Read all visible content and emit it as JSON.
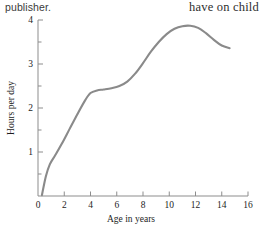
{
  "page": {
    "width": 263,
    "height": 233,
    "background": "#ffffff"
  },
  "surrounding_text": {
    "top_left": "publisher.",
    "top_right": "have on child"
  },
  "colors": {
    "curve": "#8a8a8a",
    "axis": "#8d8d8d",
    "text": "#1d1d1d",
    "sans_text": "#3a3a3a"
  },
  "chart_data": {
    "type": "line",
    "title": "",
    "xlabel": "Age in years",
    "ylabel": "Hours per day",
    "xlim": [
      0,
      16
    ],
    "ylim": [
      0,
      4.2
    ],
    "grid": false,
    "legend": null,
    "x_ticks": [
      0,
      2,
      4,
      6,
      8,
      10,
      12,
      14,
      16
    ],
    "x_tick_labels": [
      "0",
      "2",
      "4",
      "6",
      "8",
      "10",
      "12",
      "14",
      "16"
    ],
    "x_minor_ticks": [
      1,
      3,
      5,
      7,
      9,
      11,
      13,
      15
    ],
    "y_ticks": [
      1,
      2,
      3,
      4
    ],
    "y_tick_labels": [
      "1",
      "2",
      "3",
      "4"
    ],
    "y_minor_ticks": [
      0.5,
      1.5,
      2.5,
      3.5
    ],
    "series": [
      {
        "name": "Hours per day",
        "x": [
          0.3,
          0.6,
          0.9,
          1.3,
          1.8,
          2.4,
          3.0,
          3.6,
          4.0,
          4.5,
          5.0,
          5.6,
          6.2,
          6.8,
          7.4,
          8.0,
          8.6,
          9.2,
          9.8,
          10.4,
          11.0,
          11.6,
          12.2,
          12.8,
          13.4,
          14.0,
          14.6
        ],
        "y": [
          0.02,
          0.45,
          0.72,
          0.92,
          1.18,
          1.52,
          1.86,
          2.18,
          2.34,
          2.4,
          2.42,
          2.45,
          2.5,
          2.6,
          2.78,
          3.02,
          3.28,
          3.5,
          3.68,
          3.8,
          3.86,
          3.87,
          3.82,
          3.7,
          3.55,
          3.42,
          3.36
        ]
      }
    ]
  },
  "geometry": {
    "plot_left": 38,
    "plot_right": 248,
    "plot_bottom": 196,
    "plot_top": 20,
    "y_value_at_top": 4
  }
}
